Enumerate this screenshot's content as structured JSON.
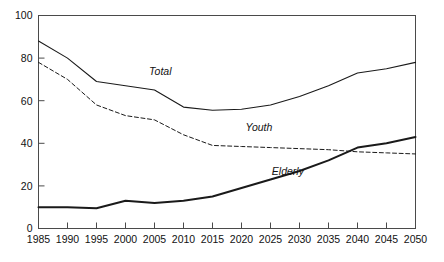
{
  "chart_data": {
    "type": "line",
    "title": "",
    "subtitle": "",
    "xlabel": "",
    "ylabel": "",
    "xlim": [
      1985,
      2050
    ],
    "ylim": [
      0,
      100
    ],
    "grid": false,
    "legend_position": "inline-annotations",
    "x": [
      1985,
      1990,
      1995,
      2000,
      2005,
      2010,
      2015,
      2020,
      2025,
      2030,
      2035,
      2040,
      2045,
      2050
    ],
    "xticks": [
      "1985",
      "1990",
      "1995",
      "2000",
      "2005",
      "2010",
      "2015",
      "2020",
      "2025",
      "2030",
      "2035",
      "2040",
      "2045",
      "2050"
    ],
    "yticks": [
      "0",
      "20",
      "40",
      "60",
      "80",
      "100"
    ],
    "ytick_values": [
      0,
      20,
      40,
      60,
      80,
      100
    ],
    "series": [
      {
        "name": "Total",
        "style": "solid",
        "width": 1.1,
        "color": "#1a1a1a",
        "label": "Total",
        "label_x": 2006,
        "label_y": 72,
        "values": [
          88,
          80,
          69,
          67,
          65,
          57,
          55.5,
          56,
          58,
          62,
          67,
          73,
          75,
          78
        ]
      },
      {
        "name": "Youth",
        "style": "dashed",
        "width": 1.0,
        "color": "#1a1a1a",
        "label": "Youth",
        "label_x": 2023,
        "label_y": 46,
        "values": [
          78,
          70,
          58,
          53,
          51,
          44,
          39,
          38.5,
          38,
          37.5,
          37,
          36,
          35.5,
          35
        ]
      },
      {
        "name": "Elderly",
        "style": "solid",
        "width": 2.0,
        "color": "#1a1a1a",
        "label": "Elderly",
        "label_x": 2028,
        "label_y": 25,
        "values": [
          10,
          10,
          9.5,
          13,
          12,
          13,
          15,
          19,
          23,
          27,
          32,
          38,
          40,
          43
        ]
      }
    ]
  },
  "axes": {
    "x_axis_name": "year-axis",
    "y_axis_name": "ratio-axis"
  }
}
